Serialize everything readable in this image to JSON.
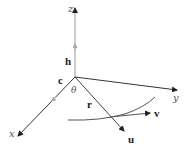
{
  "diagram": {
    "type": "3d-vector-diagram",
    "axes": {
      "z_label": "z",
      "y_label": "y",
      "x_label": "x"
    },
    "vectors": {
      "h_label": "h",
      "c_label": "c",
      "r_label": "r",
      "u_label": "u",
      "v_label": "v"
    },
    "angle_label": "θ",
    "colors": {
      "axis": "#333333",
      "vector": "#444444",
      "midpoint_arrow": "#999999",
      "curve": "#555555",
      "label": "#222222"
    }
  }
}
